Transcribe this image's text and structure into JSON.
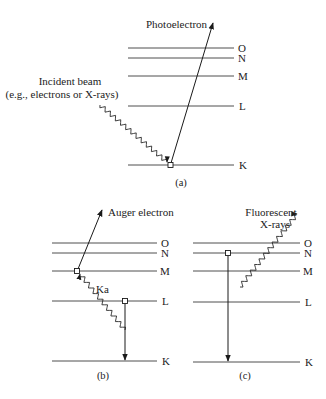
{
  "figure": {
    "panels": [
      {
        "id": "a",
        "caption": "(a)",
        "levels": [
          "O",
          "N",
          "M",
          "L",
          "K"
        ],
        "labels": {
          "outgoing": "Photoelectron",
          "incident_line1": "Incident beam",
          "incident_line2": "(e.g., electrons or X-rays)"
        }
      },
      {
        "id": "b",
        "caption": "(b)",
        "levels": [
          "O",
          "N",
          "M",
          "L",
          "K"
        ],
        "labels": {
          "outgoing": "Auger electron",
          "transition": "Ka"
        }
      },
      {
        "id": "c",
        "caption": "(c)",
        "levels": [
          "O",
          "N",
          "M",
          "L",
          "K"
        ],
        "labels": {
          "outgoing_line1": "Fluorescent",
          "outgoing_line2": "X-rays"
        }
      }
    ],
    "colors": {
      "line": "#3a3a3a",
      "background": "#ffffff"
    }
  }
}
